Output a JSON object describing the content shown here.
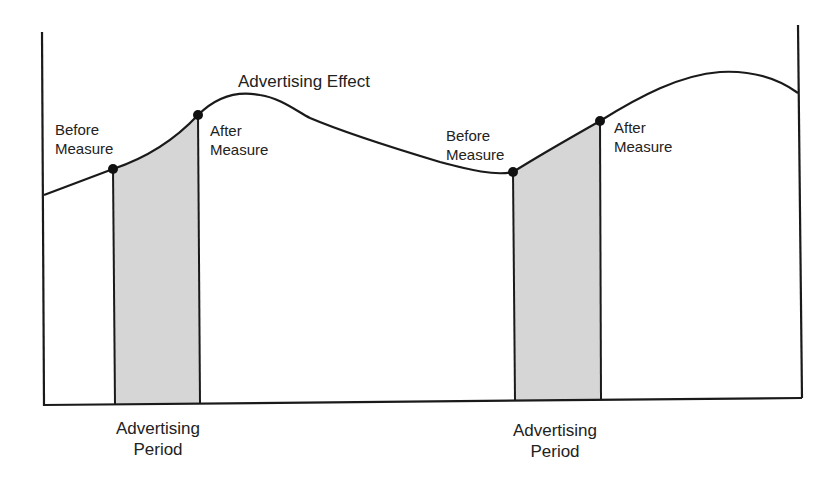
{
  "diagram": {
    "title": "Advertising Effect",
    "periods": [
      {
        "before_label": [
          "Before",
          "Measure"
        ],
        "after_label": [
          "After",
          "Measure"
        ],
        "period_label": [
          "Advertising",
          "Period"
        ]
      },
      {
        "before_label": [
          "Before",
          "Measure"
        ],
        "after_label": [
          "After",
          "Measure"
        ],
        "period_label": [
          "Advertising",
          "Period"
        ]
      }
    ],
    "colors": {
      "line": "#1a1a1a",
      "shade": "#d6d6d6",
      "background": "#ffffff"
    }
  }
}
